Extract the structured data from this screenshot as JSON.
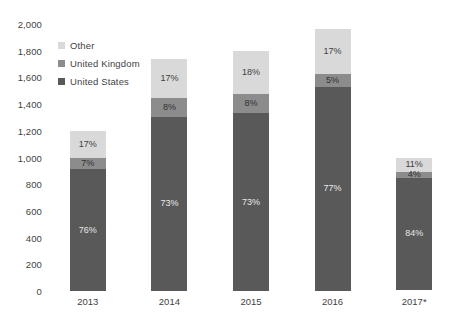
{
  "chart_data": {
    "type": "bar",
    "stacked": true,
    "title": "",
    "subtitle": "",
    "xlabel": "",
    "ylabel": "",
    "categories": [
      "2013",
      "2014",
      "2015",
      "2016",
      "2017*"
    ],
    "ylim": [
      0,
      2000
    ],
    "yticks": [
      "0",
      "200",
      "400",
      "600",
      "800",
      "1,000",
      "1,200",
      "1,400",
      "1,600",
      "1,800",
      "2,000"
    ],
    "ytick_values": [
      0,
      200,
      400,
      600,
      800,
      1000,
      1200,
      1400,
      1600,
      1800,
      2000
    ],
    "grid": false,
    "legend_position": "upper-left-inside",
    "totals": [
      1200,
      1740,
      1800,
      1960,
      1000
    ],
    "series": [
      {
        "name": "Other",
        "color": "#d9d9d9",
        "values": [
          204,
          296,
          324,
          333,
          110
        ],
        "labels": [
          "17%",
          "17%",
          "18%",
          "17%",
          "11%"
        ]
      },
      {
        "name": "United Kingdom",
        "color": "#8c8c8c",
        "values": [
          84,
          139,
          144,
          98,
          40
        ],
        "labels": [
          "7%",
          "8%",
          "8%",
          "5%",
          "4%"
        ]
      },
      {
        "name": "United States",
        "color": "#595959",
        "values": [
          912,
          1305,
          1332,
          1529,
          840
        ],
        "labels": [
          "76%",
          "73%",
          "73%",
          "77%",
          "84%"
        ]
      }
    ]
  },
  "legend": {
    "items": [
      {
        "label": "Other",
        "color": "#d9d9d9"
      },
      {
        "label": "United Kingdom",
        "color": "#8c8c8c"
      },
      {
        "label": "United States",
        "color": "#595959"
      }
    ]
  }
}
